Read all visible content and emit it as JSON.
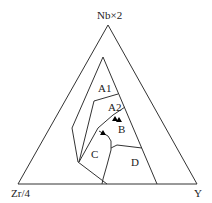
{
  "diagram": {
    "type": "ternary",
    "vertices": {
      "top": "Nb×2",
      "bottom_left": "Zr/4",
      "bottom_right": "Y"
    },
    "fields": [
      "A1",
      "A2",
      "B",
      "C",
      "D"
    ],
    "data_points": {
      "symbol": "filled-triangle",
      "count": 3,
      "color": "#000000"
    }
  }
}
